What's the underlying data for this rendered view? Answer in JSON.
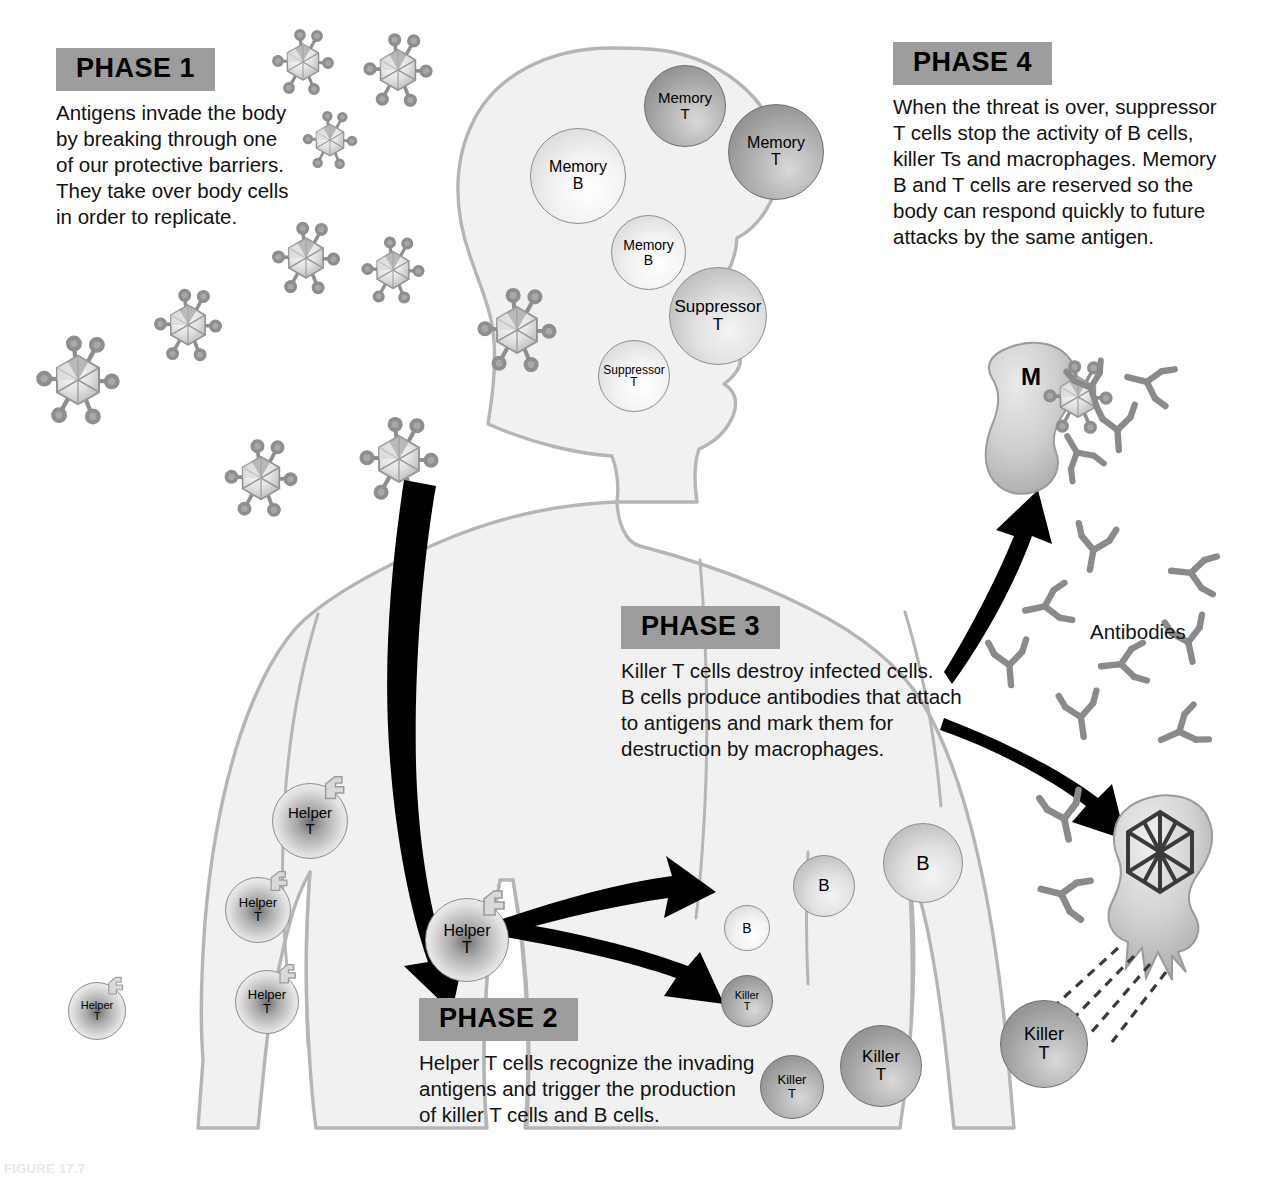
{
  "figure": {
    "caption": "FIGURE 17.7",
    "antibodies_label": "Antibodies",
    "macrophage_label": "M"
  },
  "phases": [
    {
      "tag": "PHASE 1",
      "text": "Antigens invade the body\nby breaking through one\nof our protective barriers.\nThey take over body cells\nin order to replicate."
    },
    {
      "tag": "PHASE 2",
      "text": "Helper T cells recognize the invading\nantigens and trigger the production\nof killer T cells and B cells."
    },
    {
      "tag": "PHASE 3",
      "text": "Killer T cells destroy infected cells.\nB cells produce antibodies that attach\nto antigens and mark them for\ndestruction by macrophages."
    },
    {
      "tag": "PHASE 4",
      "text": "When the threat is over, suppressor\nT cells stop the activity of B cells,\nkiller Ts and macrophages. Memory\nB and T cells are reserved so the\nbody can respond quickly to future\nattacks by the same antigen."
    }
  ],
  "cells": [
    {
      "name": "memory-t-cell",
      "line1": "Memory",
      "line2": "T",
      "x": 644,
      "y": 65,
      "d": 82,
      "tone": "dark",
      "fs": 15,
      "receptor": false
    },
    {
      "name": "memory-t-cell",
      "line1": "Memory",
      "line2": "T",
      "x": 728,
      "y": 104,
      "d": 96,
      "tone": "dark",
      "fs": 16,
      "receptor": false
    },
    {
      "name": "memory-b-cell",
      "line1": "Memory",
      "line2": "B",
      "x": 530,
      "y": 128,
      "d": 96,
      "tone": "light",
      "fs": 16,
      "receptor": false
    },
    {
      "name": "memory-b-cell",
      "line1": "Memory",
      "line2": "B",
      "x": 611,
      "y": 215,
      "d": 75,
      "tone": "light",
      "fs": 14,
      "receptor": false
    },
    {
      "name": "suppressor-t-cell",
      "line1": "Suppressor",
      "line2": "T",
      "x": 669,
      "y": 267,
      "d": 98,
      "tone": "mid",
      "fs": 17,
      "receptor": false
    },
    {
      "name": "suppressor-t-cell",
      "line1": "Suppressor",
      "line2": "T",
      "x": 598,
      "y": 340,
      "d": 72,
      "tone": "light",
      "fs": 12,
      "receptor": false
    },
    {
      "name": "helper-t-cell",
      "line1": "Helper",
      "line2": "T",
      "x": 272,
      "y": 783,
      "d": 76,
      "tone": "helper",
      "fs": 15,
      "receptor": true
    },
    {
      "name": "helper-t-cell",
      "line1": "Helper",
      "line2": "T",
      "x": 225,
      "y": 877,
      "d": 66,
      "tone": "helper",
      "fs": 13,
      "receptor": true
    },
    {
      "name": "helper-t-cell",
      "line1": "Helper",
      "line2": "T",
      "x": 235,
      "y": 970,
      "d": 64,
      "tone": "helper",
      "fs": 13,
      "receptor": true
    },
    {
      "name": "helper-t-cell",
      "line1": "Helper",
      "line2": "T",
      "x": 68,
      "y": 982,
      "d": 58,
      "tone": "helper",
      "fs": 11,
      "receptor": true
    },
    {
      "name": "helper-t-cell",
      "line1": "Helper",
      "line2": "T",
      "x": 425,
      "y": 898,
      "d": 84,
      "tone": "helper",
      "fs": 16,
      "receptor": true
    },
    {
      "name": "b-cell",
      "line1": "B",
      "line2": "",
      "x": 724,
      "y": 905,
      "d": 46,
      "tone": "light",
      "fs": 14,
      "receptor": false
    },
    {
      "name": "b-cell",
      "line1": "B",
      "line2": "",
      "x": 793,
      "y": 855,
      "d": 62,
      "tone": "mid",
      "fs": 17,
      "receptor": false
    },
    {
      "name": "b-cell",
      "line1": "B",
      "line2": "",
      "x": 883,
      "y": 823,
      "d": 80,
      "tone": "mid",
      "fs": 20,
      "receptor": false
    },
    {
      "name": "killer-t-cell",
      "line1": "Killer",
      "line2": "T",
      "x": 721,
      "y": 975,
      "d": 52,
      "tone": "dark",
      "fs": 11,
      "receptor": false
    },
    {
      "name": "killer-t-cell",
      "line1": "Killer",
      "line2": "T",
      "x": 760,
      "y": 1055,
      "d": 64,
      "tone": "dark",
      "fs": 13,
      "receptor": false
    },
    {
      "name": "killer-t-cell",
      "line1": "Killer",
      "line2": "T",
      "x": 840,
      "y": 1025,
      "d": 82,
      "tone": "dark",
      "fs": 17,
      "receptor": false
    },
    {
      "name": "killer-t-cell",
      "line1": "Killer",
      "line2": "T",
      "x": 1000,
      "y": 1000,
      "d": 88,
      "tone": "dark",
      "fs": 18,
      "receptor": false
    }
  ],
  "viruses": [
    {
      "x": 303,
      "y": 62,
      "s": 1.0
    },
    {
      "x": 398,
      "y": 70,
      "s": 1.12
    },
    {
      "x": 330,
      "y": 140,
      "s": 0.88
    },
    {
      "x": 306,
      "y": 258,
      "s": 1.1
    },
    {
      "x": 393,
      "y": 270,
      "s": 1.02
    },
    {
      "x": 188,
      "y": 325,
      "s": 1.1
    },
    {
      "x": 78,
      "y": 380,
      "s": 1.35
    },
    {
      "x": 261,
      "y": 478,
      "s": 1.18
    },
    {
      "x": 399,
      "y": 459,
      "s": 1.28
    },
    {
      "x": 517,
      "y": 330,
      "s": 1.28
    }
  ],
  "antibodies": [
    {
      "x": 1093,
      "y": 395,
      "r": -18,
      "s": 0.95
    },
    {
      "x": 1073,
      "y": 446,
      "r": 150,
      "s": 0.95
    },
    {
      "x": 1092,
      "y": 558,
      "r": 10,
      "s": 1.0
    },
    {
      "x": 1183,
      "y": 572,
      "r": 96,
      "s": 1.0
    },
    {
      "x": 1037,
      "y": 608,
      "r": 78,
      "s": 1.0
    },
    {
      "x": 1190,
      "y": 650,
      "r": -12,
      "s": 1.0
    },
    {
      "x": 1113,
      "y": 665,
      "r": 84,
      "s": 1.0
    },
    {
      "x": 1010,
      "y": 673,
      "r": -5,
      "s": 1.0
    },
    {
      "x": 1082,
      "y": 725,
      "r": -8,
      "s": 1.0
    },
    {
      "x": 1172,
      "y": 735,
      "r": 66,
      "s": 1.0
    },
    {
      "x": 1066,
      "y": 827,
      "r": -12,
      "s": 1.05
    },
    {
      "x": 1053,
      "y": 892,
      "r": 104,
      "s": 1.05
    }
  ],
  "colors": {
    "phase_tag_bg": "#9d9d9d",
    "body_fill": "#f1f1f1",
    "body_stroke": "#b5b5b5",
    "arrow": "#000000",
    "cell_stroke": "#8c8c8c",
    "antibody": "#8a8a8a",
    "text": "#111111"
  }
}
